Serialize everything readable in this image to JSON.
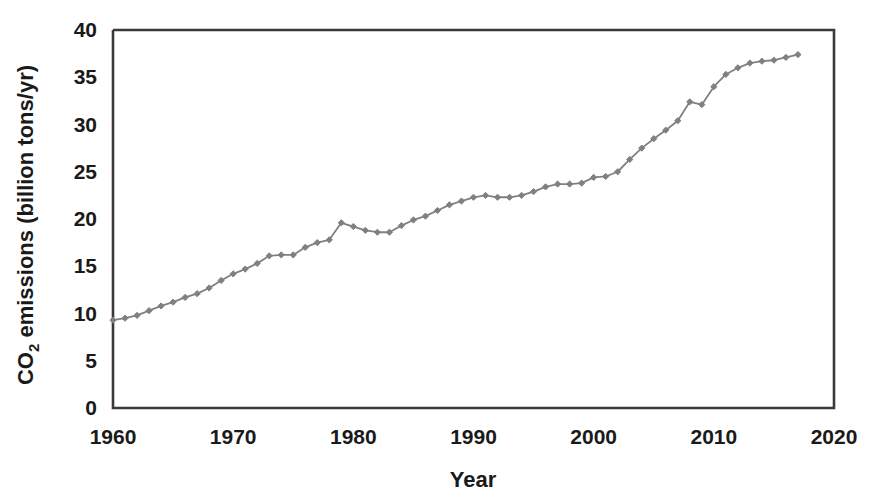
{
  "chart_data": {
    "type": "line",
    "title": "",
    "xlabel": "Year",
    "ylabel_parts": {
      "prefix": "CO",
      "subscript": "2",
      "suffix": " emissions (billion tons/yr)"
    },
    "ylabel": "CO2 emissions (billion tons/yr)",
    "xlim": [
      1960,
      2020
    ],
    "ylim": [
      0,
      40
    ],
    "xticks": [
      1960,
      1970,
      1980,
      1990,
      2000,
      2010,
      2020
    ],
    "yticks": [
      0,
      5,
      10,
      15,
      20,
      25,
      30,
      35,
      40
    ],
    "xtick_labels": [
      "1960",
      "1970",
      "1980",
      "1990",
      "2000",
      "2010",
      "2020"
    ],
    "ytick_labels": [
      "0",
      "5",
      "10",
      "15",
      "20",
      "25",
      "30",
      "35",
      "40"
    ],
    "grid": false,
    "legend": false,
    "legend_position": "none",
    "series": [
      {
        "name": "Global CO2 emissions",
        "color": "#808080",
        "marker": "diamond",
        "x": [
          1960,
          1961,
          1962,
          1963,
          1964,
          1965,
          1966,
          1967,
          1968,
          1969,
          1970,
          1971,
          1972,
          1973,
          1974,
          1975,
          1976,
          1977,
          1978,
          1979,
          1980,
          1981,
          1982,
          1983,
          1984,
          1985,
          1986,
          1987,
          1988,
          1989,
          1990,
          1991,
          1992,
          1993,
          1994,
          1995,
          1996,
          1997,
          1998,
          1999,
          2000,
          2001,
          2002,
          2003,
          2004,
          2005,
          2006,
          2007,
          2008,
          2009,
          2010,
          2011,
          2012,
          2013,
          2014,
          2015,
          2016,
          2017
        ],
        "values": [
          9.3,
          9.5,
          9.8,
          10.3,
          10.8,
          11.2,
          11.7,
          12.1,
          12.7,
          13.5,
          14.2,
          14.7,
          15.3,
          16.1,
          16.2,
          16.2,
          17.0,
          17.5,
          17.8,
          19.6,
          19.2,
          18.8,
          18.6,
          18.6,
          19.3,
          19.9,
          20.3,
          20.9,
          21.5,
          21.9,
          22.3,
          22.5,
          22.3,
          22.3,
          22.5,
          22.9,
          23.4,
          23.7,
          23.7,
          23.8,
          24.4,
          24.5,
          25.0,
          26.3,
          27.5,
          28.5,
          29.4,
          30.4,
          32.4,
          32.1,
          34.0,
          35.3,
          36.0,
          36.5,
          36.7,
          36.8,
          37.1,
          37.4
        ]
      }
    ]
  },
  "axis_style": {
    "frame_color": "#3a3a3a",
    "text_color": "#1a1a1a",
    "background": "#ffffff"
  }
}
